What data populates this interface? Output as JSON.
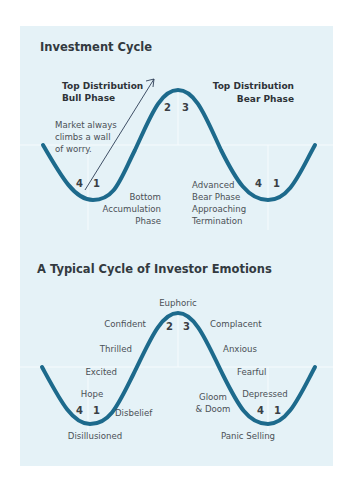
{
  "chart1": {
    "title": "Investment Cycle",
    "top_left": [
      "Top Distribution",
      "Bull Phase"
    ],
    "top_right": [
      "Top Distribution",
      "Bear Phase"
    ],
    "wall_note": [
      "Market always",
      "climbs a wall",
      "of worry."
    ],
    "bottom_left": [
      "Bottom",
      "Accumulation",
      "Phase"
    ],
    "bottom_right": [
      "Advanced",
      "Bear Phase",
      "Approaching",
      "Termination"
    ],
    "numbers": {
      "left4": "4",
      "left1": "1",
      "peak2": "2",
      "peak3": "3",
      "right4": "4",
      "right1": "1"
    }
  },
  "chart2": {
    "title": "A Typical Cycle of Investor Emotions",
    "emotions": {
      "euphoric": "Euphoric",
      "confident": "Confident",
      "thrilled": "Thrilled",
      "excited": "Excited",
      "hope": "Hope",
      "disbelief": "Disbelief",
      "disillusioned": "Disillusioned",
      "complacent": "Complacent",
      "anxious": "Anxious",
      "fearful": "Fearful",
      "depressed": "Depressed",
      "gloom": [
        "Gloom",
        "& Doom"
      ],
      "panic": "Panic Selling"
    },
    "numbers": {
      "left4": "4",
      "left1": "1",
      "peak2": "2",
      "peak3": "3",
      "right4": "4",
      "right1": "1"
    }
  },
  "colors": {
    "panel_bg": "#e5f2f7",
    "curve": "#1d6a8c",
    "text": "#333a40"
  }
}
